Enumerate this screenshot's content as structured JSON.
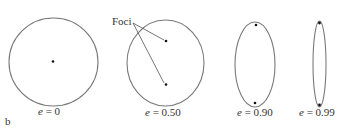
{
  "figure": {
    "panel_label": "b",
    "foci_label": "Foci",
    "stroke_color": "#7a7a7a",
    "dot_color": "#111111",
    "ellipses": [
      {
        "e_var": "e",
        "eq": "=",
        "value": "0"
      },
      {
        "e_var": "e",
        "eq": "=",
        "value": "0.50"
      },
      {
        "e_var": "e",
        "eq": "=",
        "value": "0.90"
      },
      {
        "e_var": "e",
        "eq": "=",
        "value": "0.99"
      }
    ]
  }
}
